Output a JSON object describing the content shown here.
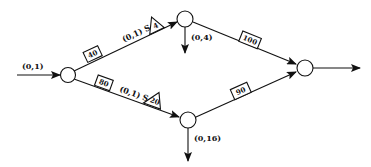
{
  "diagram": {
    "type": "flow-network",
    "nodes": [
      {
        "id": "source",
        "cx": 68,
        "cy": 75
      },
      {
        "id": "top",
        "cx": 185,
        "cy": 19
      },
      {
        "id": "bottom",
        "cx": 188,
        "cy": 120
      },
      {
        "id": "sink",
        "cx": 305,
        "cy": 68
      }
    ],
    "input": {
      "label": "(0,1)"
    },
    "output": {
      "label": ""
    },
    "edges": [
      {
        "from": "source",
        "to": "top",
        "box": "40",
        "label": "(0,1) S",
        "triangle": "4"
      },
      {
        "from": "source",
        "to": "bottom",
        "box": "80",
        "label": "(0,1) S",
        "triangle": "20"
      },
      {
        "from": "top",
        "to": "sink",
        "box": "100"
      },
      {
        "from": "bottom",
        "to": "sink",
        "box": "90"
      }
    ],
    "outflows": [
      {
        "node": "top",
        "label": "(0,4)"
      },
      {
        "node": "bottom",
        "label": "(0,16)"
      }
    ]
  }
}
